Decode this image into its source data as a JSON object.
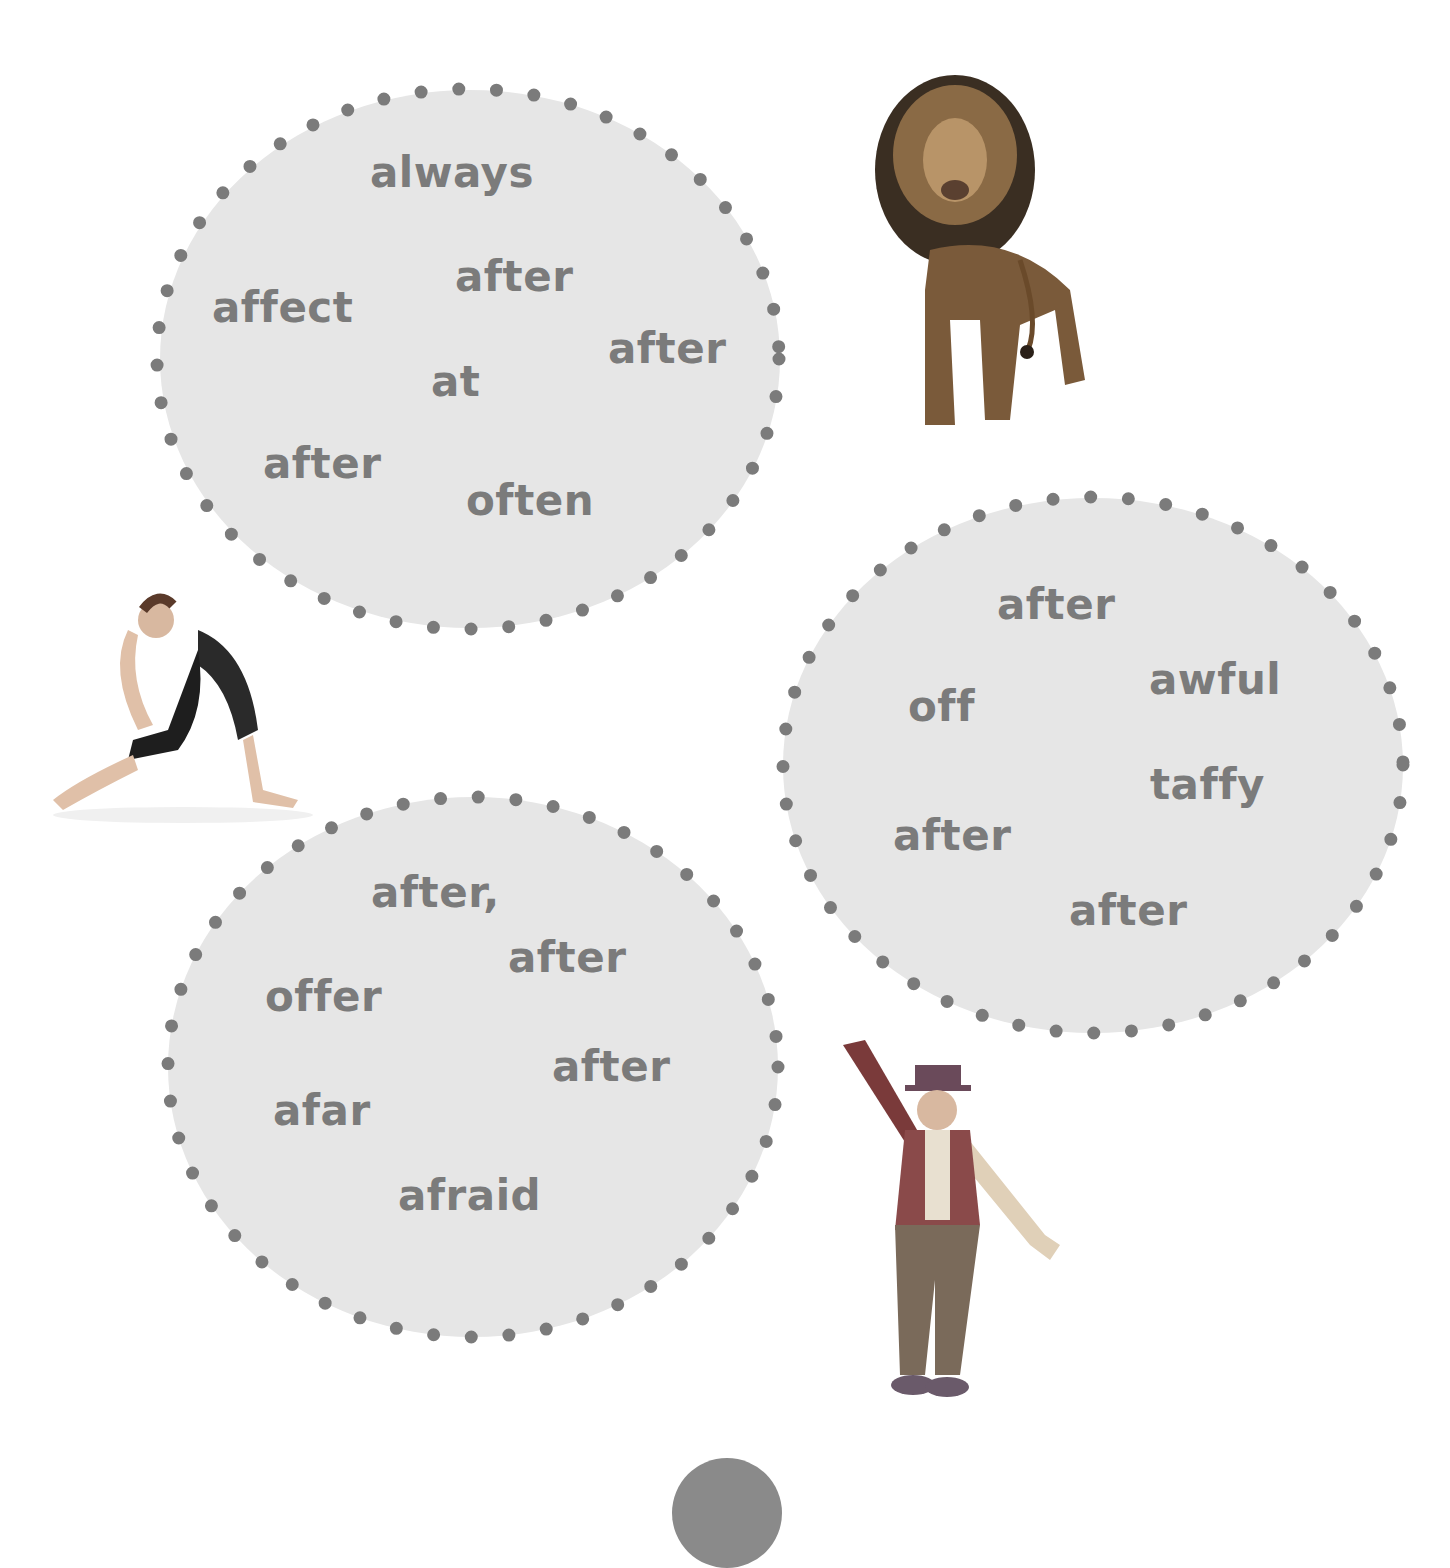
{
  "style": {
    "oval_fill": "#e6e6e6",
    "dot_color": "#7b7b7b",
    "word_color": "#7b7b7b"
  },
  "ovals": [
    {
      "id": "top-left",
      "words": [
        {
          "text": "always",
          "x": 370,
          "y": 152
        },
        {
          "text": "after",
          "x": 455,
          "y": 256
        },
        {
          "text": "affect",
          "x": 212,
          "y": 287
        },
        {
          "text": "after",
          "x": 608,
          "y": 328
        },
        {
          "text": "at",
          "x": 431,
          "y": 361
        },
        {
          "text": "after",
          "x": 263,
          "y": 443
        },
        {
          "text": "often",
          "x": 466,
          "y": 480
        }
      ]
    },
    {
      "id": "right",
      "words": [
        {
          "text": "after",
          "x": 997,
          "y": 584
        },
        {
          "text": "awful",
          "x": 1149,
          "y": 659
        },
        {
          "text": "off",
          "x": 908,
          "y": 686
        },
        {
          "text": "taffy",
          "x": 1150,
          "y": 764
        },
        {
          "text": "after",
          "x": 893,
          "y": 815
        },
        {
          "text": "after",
          "x": 1069,
          "y": 890
        }
      ]
    },
    {
      "id": "bottom-left",
      "words": [
        {
          "text": "after,",
          "x": 371,
          "y": 872
        },
        {
          "text": "after",
          "x": 508,
          "y": 937
        },
        {
          "text": "offer",
          "x": 265,
          "y": 976
        },
        {
          "text": "after",
          "x": 552,
          "y": 1046
        },
        {
          "text": "afar",
          "x": 273,
          "y": 1090
        },
        {
          "text": "afraid",
          "x": 398,
          "y": 1175
        }
      ]
    }
  ],
  "images": [
    {
      "name": "lion",
      "label": "lion"
    },
    {
      "name": "gymnast",
      "label": "gymnast"
    },
    {
      "name": "clown",
      "label": "clown"
    }
  ]
}
